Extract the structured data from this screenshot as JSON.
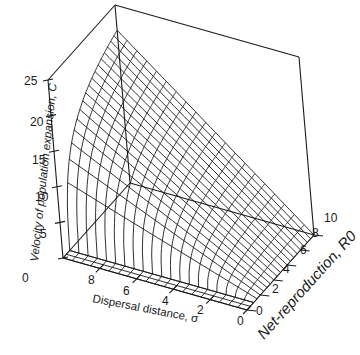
{
  "chart_data": {
    "type": "surface3d",
    "title": "",
    "zlabel": "Velocity of population expansion, C",
    "xlabel": "Dispersal distance, σ",
    "ylabel": "Net-reproduction, R0",
    "z_ticks": [
      "0",
      "5",
      "10",
      "15",
      "20",
      "25"
    ],
    "x_ticks": [
      "8",
      "6",
      "4",
      "2",
      "0"
    ],
    "y_ticks": [
      "0",
      "2",
      "4",
      "6",
      "8",
      "10"
    ],
    "zlim": [
      0,
      25
    ],
    "xlim": [
      0,
      10
    ],
    "ylim": [
      0,
      10
    ],
    "formula": "C = σ·sqrt(2·ln R0)",
    "grid": "wireframe",
    "line_color": "#1a1a1a",
    "background": "#ffffff",
    "sample_values": [
      {
        "sigma": 10,
        "R0": 10,
        "C": 21.5
      },
      {
        "sigma": 10,
        "R0": 5,
        "C": 17.9
      },
      {
        "sigma": 10,
        "R0": 2,
        "C": 11.8
      },
      {
        "sigma": 5,
        "R0": 10,
        "C": 10.7
      },
      {
        "sigma": 5,
        "R0": 5,
        "C": 9.0
      },
      {
        "sigma": 2,
        "R0": 10,
        "C": 4.3
      },
      {
        "sigma": 0,
        "R0": 10,
        "C": 0
      },
      {
        "sigma": 10,
        "R0": 1,
        "C": 0
      }
    ]
  }
}
